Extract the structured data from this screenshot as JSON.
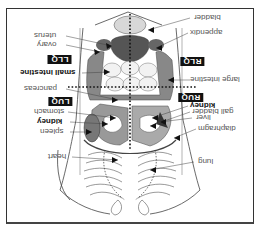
{
  "diagram": {
    "orientation_deg": 180,
    "colors": {
      "frame": "#333333",
      "organ_dark": "#555555",
      "organ_mid": "#888888",
      "organ_light": "#cccccc",
      "badge_bg": "#111111",
      "badge_fg": "#ffffff",
      "label_text": "#555555"
    },
    "quadrants": {
      "llq": "LLQ",
      "luq": "LUQ",
      "rlq": "RLQ",
      "ruq": "RUQ"
    },
    "labels_left": {
      "uterus": "uterus",
      "ovary": "ovary",
      "small_intestine": "small intestine",
      "pancreas": "pancreas",
      "stomach": "stomach",
      "kidney": "kidney",
      "spleen": "spleen",
      "heart": "heart"
    },
    "labels_right": {
      "bladder": "bladder",
      "appendix": "appendix",
      "large_intestine": "large intestine",
      "kidney": "kidney",
      "gall_bladder": "gall bladder",
      "liver": "liver",
      "diaphragm": "diaphragm",
      "lung": "lung"
    }
  }
}
